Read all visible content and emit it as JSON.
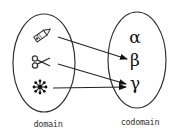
{
  "diagram": {
    "type": "function-mapping",
    "domain": {
      "label": "domain",
      "elements": [
        {
          "id": "pencil",
          "icon": "pencil-icon"
        },
        {
          "id": "scissors",
          "icon": "scissors-icon"
        },
        {
          "id": "asterisk",
          "icon": "asterisk-icon"
        }
      ]
    },
    "codomain": {
      "label": "codomain",
      "elements": [
        {
          "id": "alpha",
          "symbol": "α"
        },
        {
          "id": "beta",
          "symbol": "β"
        },
        {
          "id": "gamma",
          "symbol": "γ"
        }
      ]
    },
    "mappings": [
      {
        "from": "pencil",
        "to": "beta"
      },
      {
        "from": "scissors",
        "to": "gamma"
      },
      {
        "from": "asterisk",
        "to": "gamma"
      }
    ],
    "colors": {
      "stroke": "#333333",
      "text": "#111111",
      "background": "#ffffff"
    }
  }
}
